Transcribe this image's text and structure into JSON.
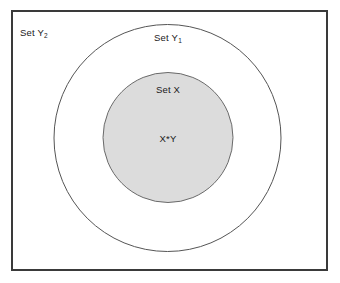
{
  "diagram": {
    "type": "venn-nested-sets",
    "canvas": {
      "width": 340,
      "height": 283,
      "background": "#ffffff"
    },
    "outer_rectangle": {
      "label_name": "universe-rectangle",
      "x": 12,
      "y": 11,
      "width": 315,
      "height": 259,
      "fill": "#ffffff",
      "stroke": "#3a3a3a",
      "stroke_width": 1.6
    },
    "labels": {
      "set_y2": {
        "text": "Set Y",
        "subscript": "2",
        "x": 20,
        "y": 36
      },
      "set_y1": {
        "text": "Set Y",
        "subscript": "1",
        "x": 168,
        "y": 41
      },
      "set_x": {
        "text": "Set X",
        "subscript": "",
        "x": 168,
        "y": 93
      },
      "intersection": {
        "text": "X*Y",
        "subscript": "",
        "x": 168,
        "y": 142
      }
    },
    "circles": [
      {
        "name": "outer-circle-set-y1",
        "label": "Set Y1",
        "cx": 167.5,
        "cy": 138,
        "r": 113.5,
        "fill": "#ffffff",
        "stroke": "#555555",
        "stroke_width": 1
      },
      {
        "name": "inner-circle-set-x",
        "label": "Set X",
        "cx": 168,
        "cy": 137.5,
        "r": 65,
        "fill": "#dcdcdc",
        "stroke": "#6a6a6a",
        "stroke_width": 1
      }
    ]
  },
  "chart_data": {
    "type": "diagram",
    "title": "",
    "sets": [
      {
        "name": "Set Y2",
        "display": "Set Y₂",
        "shape": "rectangle",
        "contains": [
          "Set Y1",
          "Set X"
        ],
        "fill": "#ffffff"
      },
      {
        "name": "Set Y1",
        "display": "Set Y₁",
        "shape": "circle",
        "contains": [
          "Set X"
        ],
        "fill": "#ffffff"
      },
      {
        "name": "Set X",
        "display": "Set X",
        "shape": "circle",
        "contains": [
          "X*Y"
        ],
        "fill": "#dcdcdc"
      }
    ],
    "regions": [
      {
        "label": "X*Y",
        "within": "Set X",
        "shaded": true
      }
    ],
    "legend": []
  }
}
